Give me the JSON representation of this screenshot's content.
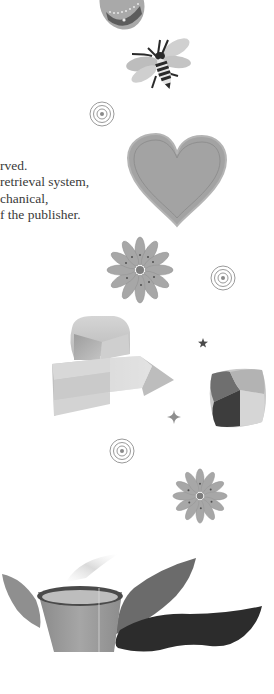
{
  "page": {
    "background": "#ffffff",
    "copyright_text_lines": [
      "rved.",
      "retrieval system,",
      "chanical,",
      "f the publisher."
    ]
  },
  "illustrations": [
    {
      "name": "egg-ornament",
      "icon": "decorated-egg-icon"
    },
    {
      "name": "bee",
      "icon": "bee-icon"
    },
    {
      "name": "spiral-1",
      "icon": "concentric-circles-icon"
    },
    {
      "name": "heart",
      "icon": "heart-icon"
    },
    {
      "name": "flower-1",
      "icon": "daisy-flower-icon"
    },
    {
      "name": "spiral-2",
      "icon": "concentric-circles-icon"
    },
    {
      "name": "crystal",
      "icon": "crystal-icon"
    },
    {
      "name": "star",
      "icon": "star-icon"
    },
    {
      "name": "sparkle",
      "icon": "sparkle-icon"
    },
    {
      "name": "gem-stone",
      "icon": "gem-stone-icon"
    },
    {
      "name": "spiral-3",
      "icon": "concentric-circles-icon"
    },
    {
      "name": "flower-2",
      "icon": "daisy-flower-icon"
    },
    {
      "name": "tea-cup-with-leaves",
      "icon": "tea-cup-icon"
    }
  ],
  "colors": {
    "text": "#3a3a3a",
    "light_gray": "#c8c8c8",
    "mid_gray": "#9a9a9a",
    "dark_gray": "#4a4a4a",
    "near_black": "#2a2a2a"
  }
}
